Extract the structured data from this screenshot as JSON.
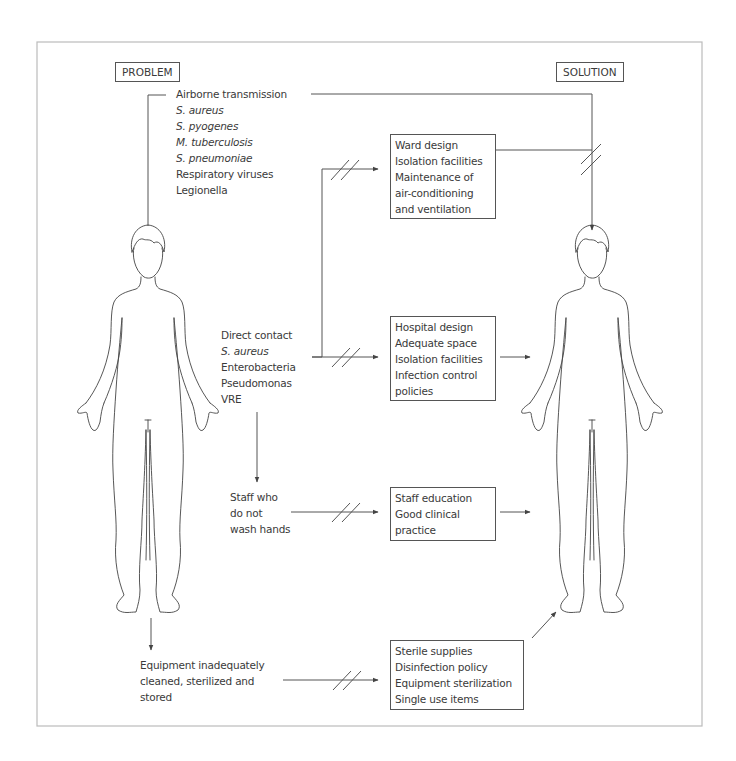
{
  "diagram": {
    "headers": {
      "problem": "PROBLEM",
      "solution": "SOLUTION"
    },
    "problems": {
      "airborne": {
        "title": "Airborne transmission",
        "organisms": [
          "S. aureus",
          "S. pyogenes",
          "M. tuberculosis",
          "S. pneumoniae"
        ],
        "others": [
          "Respiratory viruses",
          "Legionella"
        ]
      },
      "direct_contact": {
        "title": "Direct contact",
        "organisms": [
          "S. aureus"
        ],
        "others": [
          "Enterobacteria",
          "Pseudomonas",
          "VRE"
        ]
      },
      "staff": {
        "lines": [
          "Staff who",
          "do not",
          "wash hands"
        ]
      },
      "equipment": {
        "lines": [
          "Equipment inadequately",
          "cleaned, sterilized and",
          "stored"
        ]
      }
    },
    "solutions": {
      "ward": [
        "Ward design",
        "Isolation facilities",
        "Maintenance of",
        "air-conditioning",
        "and ventilation"
      ],
      "hospital": [
        "Hospital design",
        "Adequate space",
        "Isolation facilities",
        "Infection control",
        "policies"
      ],
      "staff": [
        "Staff education",
        "Good clinical",
        "practice"
      ],
      "equipment": [
        "Sterile supplies",
        "Disinfection policy",
        "Equipment sterilization",
        "Single use items"
      ]
    },
    "figures": [
      {
        "role": "patient-problem"
      },
      {
        "role": "patient-solution"
      }
    ],
    "colors": {
      "line": "#555555",
      "text": "#3a3a3a",
      "frame": "#bbbbbb"
    }
  }
}
